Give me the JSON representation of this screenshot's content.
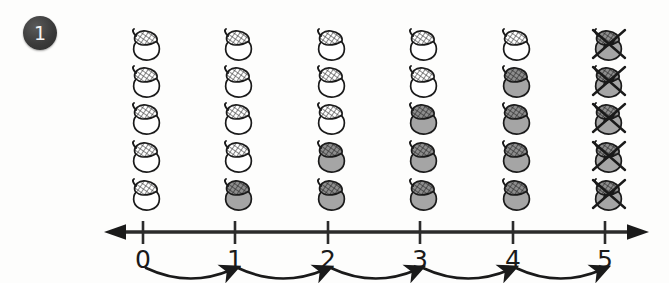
{
  "problem": {
    "number_badge": "1",
    "badge_icon": "circle-number-badge"
  },
  "grid": {
    "rows": 5,
    "columns": 6,
    "object_icon": "acorn-icon",
    "states": [
      [
        "white",
        "white",
        "white",
        "white",
        "white",
        "crossed"
      ],
      [
        "white",
        "white",
        "white",
        "white",
        "gray",
        "crossed"
      ],
      [
        "white",
        "white",
        "white",
        "gray",
        "gray",
        "crossed"
      ],
      [
        "white",
        "white",
        "gray",
        "gray",
        "gray",
        "crossed"
      ],
      [
        "white",
        "gray",
        "gray",
        "gray",
        "gray",
        "crossed"
      ]
    ]
  },
  "number_line": {
    "ticks": [
      "0",
      "1",
      "2",
      "3",
      "4",
      "5"
    ],
    "left_arrow_icon": "arrow-left-icon",
    "right_arrow_icon": "arrow-right-icon",
    "hops": [
      {
        "from": "0",
        "to": "1",
        "icon": "curved-hop-arrow-icon"
      },
      {
        "from": "1",
        "to": "2",
        "icon": "curved-hop-arrow-icon"
      },
      {
        "from": "2",
        "to": "3",
        "icon": "curved-hop-arrow-icon"
      },
      {
        "from": "3",
        "to": "4",
        "icon": "curved-hop-arrow-icon"
      },
      {
        "from": "4",
        "to": "5",
        "icon": "curved-hop-arrow-icon"
      }
    ]
  },
  "colors": {
    "background": "#fdfdfc",
    "ink": "#1a1a1a",
    "acorn_gray": "#a5a5a5",
    "acorn_white": "#ffffff",
    "cap_hatch": "#4a4a4a",
    "badge": "#333333"
  }
}
